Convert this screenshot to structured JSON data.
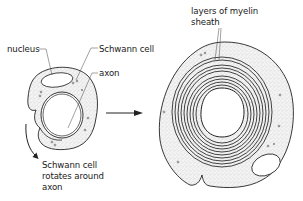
{
  "diagram": {
    "left_figure": {
      "labels": {
        "nucleus": "nucleus",
        "schwann_cell": "Schwann cell",
        "axon": "axon",
        "rotation_line1": "Schwann cell",
        "rotation_line2": "rotates around",
        "rotation_line3": "axon"
      }
    },
    "right_figure": {
      "labels": {
        "myelin_line1": "layers of myelin",
        "myelin_line2": "sheath"
      }
    },
    "arrow": "transition-arrow",
    "colors": {
      "line": "#222222",
      "stipple": "#8a8a8a",
      "background": "#ffffff"
    }
  }
}
